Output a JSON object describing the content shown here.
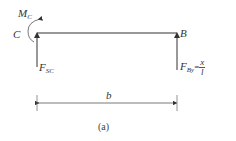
{
  "diagram": {
    "moment_label": "M",
    "moment_sub": "C",
    "left_point": "C",
    "right_point": "B",
    "left_force": "F",
    "left_force_sub": "SC",
    "right_force": "F",
    "right_force_sub": "By",
    "right_force_eq": "=",
    "right_force_num": "x",
    "right_force_den": "l",
    "dimension_label": "b",
    "caption": "(a)",
    "line_color": "#333333"
  }
}
